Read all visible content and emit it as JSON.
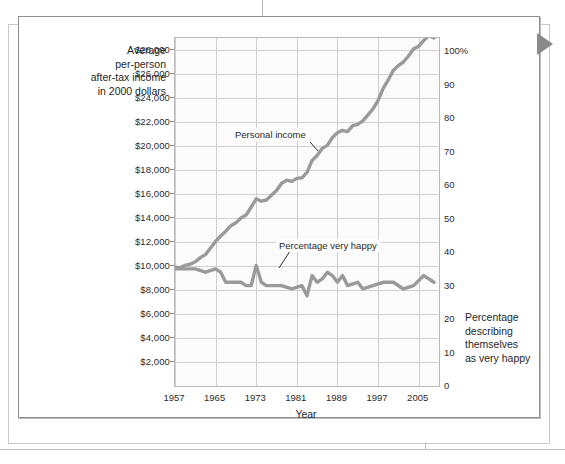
{
  "page": {
    "corner_marker": "triangle-marker"
  },
  "chart_data": {
    "type": "line",
    "title": "",
    "xlabel": "Year",
    "ylabel": "Average per-person after-tax income in 2000 dollars",
    "y2label": "Percentage describing themselves as very happy",
    "grid": true,
    "legend_position": "inline-annotations",
    "xlim": [
      1957,
      2009
    ],
    "ylim": [
      0,
      29000
    ],
    "y2lim": [
      0,
      104
    ],
    "xticks": [
      "1957",
      "1965",
      "1973",
      "1981",
      "1989",
      "1997",
      "2005"
    ],
    "xtick_values": [
      1957,
      1965,
      1973,
      1981,
      1989,
      1997,
      2005
    ],
    "yticks": [
      "$2,000",
      "$4,000",
      "$6,000",
      "$8,000",
      "$10,000",
      "$12,000",
      "$14,000",
      "$16,000",
      "$18,000",
      "$20,000",
      "$22,000",
      "$24,000",
      "$26,000",
      "$28,000"
    ],
    "ytick_values": [
      2000,
      4000,
      6000,
      8000,
      10000,
      12000,
      14000,
      16000,
      18000,
      20000,
      22000,
      24000,
      26000,
      28000
    ],
    "y2ticks": [
      "0",
      "10",
      "20",
      "30",
      "40",
      "50",
      "60",
      "70",
      "80",
      "90",
      "100%"
    ],
    "y2tick_values": [
      0,
      10,
      20,
      30,
      40,
      50,
      60,
      70,
      80,
      90,
      100
    ],
    "series": [
      {
        "name": "Personal income",
        "axis": "left",
        "color": "#9a9a9a",
        "annotation": "Personal income",
        "x": [
          1957,
          1958,
          1959,
          1960,
          1961,
          1962,
          1963,
          1964,
          1965,
          1966,
          1967,
          1968,
          1969,
          1970,
          1971,
          1972,
          1973,
          1974,
          1975,
          1976,
          1977,
          1978,
          1979,
          1980,
          1981,
          1982,
          1983,
          1984,
          1985,
          1986,
          1987,
          1988,
          1989,
          1990,
          1991,
          1992,
          1993,
          1994,
          1995,
          1996,
          1997,
          1998,
          1999,
          2000,
          2001,
          2002,
          2003,
          2004,
          2005,
          2006,
          2007,
          2008
        ],
        "values": [
          9900,
          9850,
          10050,
          10150,
          10350,
          10700,
          10950,
          11500,
          12050,
          12500,
          12900,
          13350,
          13600,
          14000,
          14250,
          14900,
          15600,
          15400,
          15500,
          15900,
          16300,
          16900,
          17150,
          17050,
          17300,
          17350,
          17800,
          18800,
          19200,
          19800,
          20050,
          20700,
          21100,
          21300,
          21200,
          21700,
          21800,
          22100,
          22600,
          23100,
          23800,
          24800,
          25500,
          26300,
          26700,
          27000,
          27500,
          28100,
          28300,
          28800,
          29200,
          29000
        ]
      },
      {
        "name": "Percentage very happy",
        "axis": "right",
        "color": "#9a9a9a",
        "annotation": "Percentage very happy",
        "x": [
          1957,
          1959,
          1961,
          1963,
          1965,
          1966,
          1967,
          1968,
          1969,
          1970,
          1971,
          1972,
          1973,
          1974,
          1975,
          1976,
          1977,
          1978,
          1980,
          1982,
          1983,
          1984,
          1985,
          1986,
          1987,
          1988,
          1989,
          1990,
          1991,
          1993,
          1994,
          1996,
          1998,
          2000,
          2002,
          2004,
          2006,
          2008
        ],
        "values": [
          35,
          35,
          35,
          34,
          35,
          34,
          31,
          31,
          31,
          31,
          30,
          30,
          36,
          31,
          30,
          30,
          30,
          30,
          29,
          30,
          27,
          33,
          31,
          32,
          34,
          33,
          31,
          33,
          30,
          31,
          29,
          30,
          31,
          31,
          29,
          30,
          33,
          31
        ]
      }
    ]
  },
  "axes": {
    "left_title": "Average\nper-person\nafter-tax income\nin 2000 dollars",
    "left_title_lines": [
      "Average",
      "per-person",
      "after-tax income",
      "in 2000 dollars"
    ],
    "right_title_lines": [
      "Percentage",
      "describing",
      "themselves",
      "as very happy"
    ],
    "x_title": "Year"
  },
  "colors": {
    "line": "#9a9a9a",
    "grid": "#d2d2d2",
    "frame": "#b9b9b9",
    "text": "#1f1f1f",
    "plot_bg": "#fbfbfb",
    "page_border": "#8d8d8d",
    "marker": "#8a8a8a"
  }
}
